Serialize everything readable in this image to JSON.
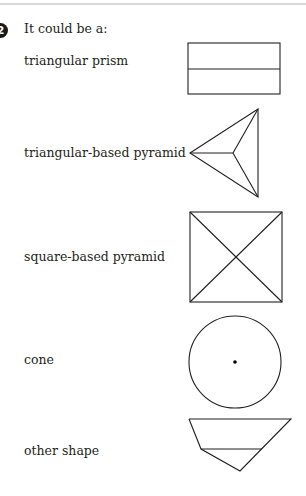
{
  "question": {
    "number": "2",
    "intro": "It could be a:"
  },
  "options": [
    {
      "label": "triangular prism",
      "shape": "rectangle-split-horizontally"
    },
    {
      "label": "triangular-based pyramid",
      "shape": "triangle-with-center-lines"
    },
    {
      "label": "square-based pyramid",
      "shape": "square-with-diagonals"
    },
    {
      "label": "cone",
      "shape": "circle-with-center-dot"
    },
    {
      "label": "other shape",
      "shape": "trapezoid-with-triangle"
    }
  ]
}
